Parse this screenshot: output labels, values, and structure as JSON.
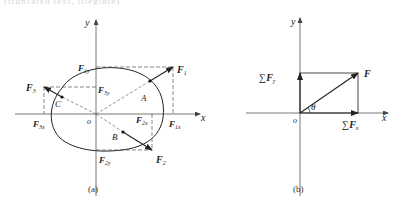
{
  "top_strip": {
    "text": "(truncated text, illegible)"
  },
  "diagram_a": {
    "caption": "(a)",
    "axes": {
      "x_label": "x",
      "y_label": "y",
      "origin_label": "o"
    },
    "points": {
      "A": "A",
      "B": "B",
      "C": "C"
    },
    "forces": {
      "F1": {
        "main": "F",
        "sub": "1",
        "x_main": "F",
        "x_sub": "1x",
        "y_main": "F",
        "y_sub": "1y"
      },
      "F2": {
        "main": "F",
        "sub": "2",
        "x_main": "F",
        "x_sub": "2x",
        "y_main": "F",
        "y_sub": "2y"
      },
      "F3": {
        "main": "F",
        "sub": "3",
        "x_main": "F",
        "x_sub": "3x",
        "y_main": "F",
        "y_sub": "3y"
      }
    }
  },
  "diagram_b": {
    "caption": "(b)",
    "axes": {
      "x_label": "x",
      "y_label": "y",
      "origin_label": "o"
    },
    "resultant": "F",
    "sum_x": {
      "sigma": "∑",
      "main": "F",
      "sub": "x"
    },
    "sum_y": {
      "sigma": "∑",
      "main": "F",
      "sub": "y"
    },
    "angle": "θ"
  },
  "colors": {
    "line": "#333333",
    "dashed": "#555555",
    "background": "#ffffff"
  }
}
